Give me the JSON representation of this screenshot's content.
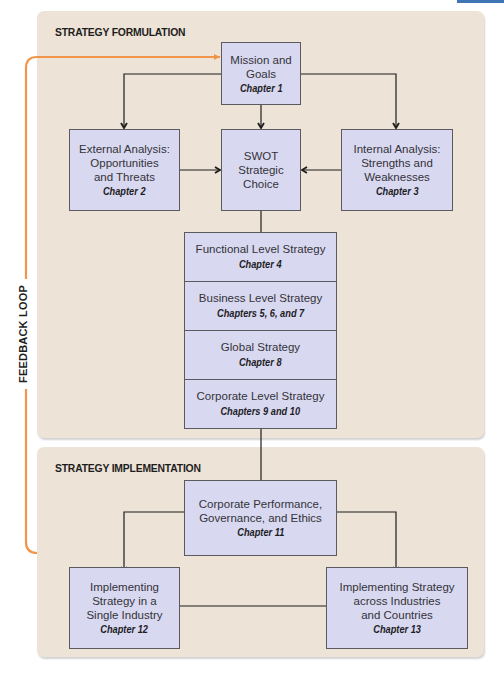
{
  "panels": {
    "formulation": {
      "title": "STRATEGY FORMULATION"
    },
    "implementation": {
      "title": "STRATEGY IMPLEMENTATION"
    }
  },
  "feedback_loop": {
    "label": "FEEDBACK LOOP",
    "color": "#f0954a"
  },
  "colors": {
    "panel_bg": "#ede3d6",
    "box_fill": "#d9d8f1",
    "box_border": "#5a5a60",
    "accent_tab": "#3f74b5"
  },
  "boxes": {
    "mission": {
      "lines": [
        "Mission and",
        "Goals"
      ],
      "chapter": "Chapter 1"
    },
    "external": {
      "lines": [
        "External Analysis:",
        "Opportunities",
        "and Threats"
      ],
      "chapter": "Chapter 2"
    },
    "swot": {
      "lines": [
        "SWOT",
        "Strategic",
        "Choice"
      ]
    },
    "internal": {
      "lines": [
        "Internal Analysis:",
        "Strengths and",
        "Weaknesses"
      ],
      "chapter": "Chapter 3"
    },
    "stack": [
      {
        "label": "Functional Level Strategy",
        "chapter": "Chapter 4"
      },
      {
        "label": "Business Level Strategy",
        "chapter": "Chapters 5, 6, and 7"
      },
      {
        "label": "Global Strategy",
        "chapter": "Chapter 8"
      },
      {
        "label": "Corporate Level Strategy",
        "chapter": "Chapters 9 and 10"
      }
    ],
    "corp_perf": {
      "lines": [
        "Corporate Performance,",
        "Governance, and Ethics"
      ],
      "chapter": "Chapter 11"
    },
    "single_industry": {
      "lines": [
        "Implementing",
        "Strategy in a",
        "Single Industry"
      ],
      "chapter": "Chapter 12"
    },
    "across_industries": {
      "lines": [
        "Implementing Strategy",
        "across Industries",
        "and Countries"
      ],
      "chapter": "Chapter 13"
    }
  }
}
